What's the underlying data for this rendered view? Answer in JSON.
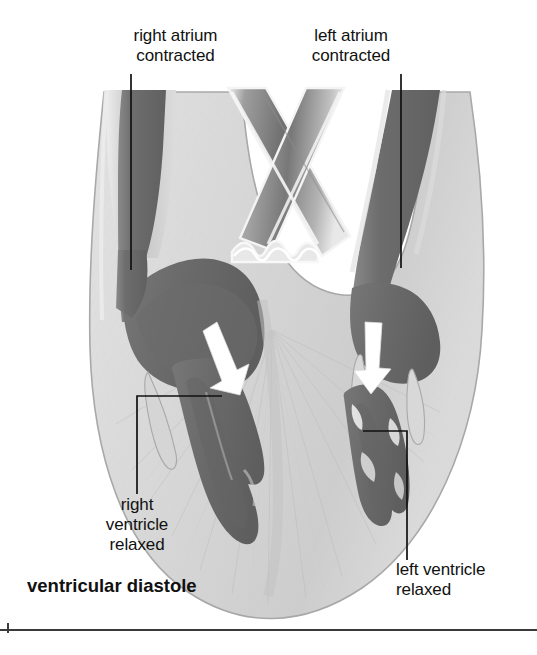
{
  "figure": {
    "title": "ventricular diastole",
    "caption_bold": "ventricular diastole"
  },
  "labels": {
    "right_atrium": "right atrium\ncontracted",
    "left_atrium": "left atrium\ncontracted",
    "right_ventricle": "right\nventricle\nrelaxed",
    "left_ventricle": "left ventricle\nrelaxed",
    "diastole": "ventricular diastole"
  },
  "colors": {
    "background": "#ffffff",
    "myocardium_light": "#d6d6d6",
    "myocardium_mid": "#c4c4c4",
    "blood_dark": "#6e6e6e",
    "blood_darker": "#5a5a5a",
    "vessel_highlight": "#f2f2f2",
    "outline": "#9a9a9a",
    "leader_line": "#111111",
    "arrow_white": "#ffffff",
    "text": "#111111",
    "rule": "#3a3a3a"
  },
  "annotations": {
    "arrow_right_side_label": "blood flow into right ventricle",
    "arrow_left_side_label": "blood flow into left ventricle",
    "arrow_count": 2
  },
  "leaders": {
    "right_atrium_line": "vertical from label down into right atrium",
    "left_atrium_line": "vertical from label down into left atrium",
    "right_ventricle_line": "elbow from right ventricle cavity out to lower-left label",
    "left_ventricle_line": "elbow from left ventricle cavity out to lower-right label"
  }
}
